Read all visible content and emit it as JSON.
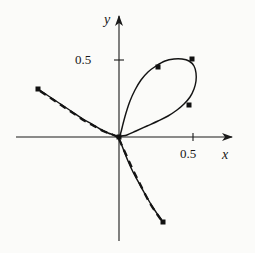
{
  "figure": {
    "kind": "parametric-curve-plot",
    "background": "#fbfbf9",
    "ink": "#1a1a1a"
  },
  "axes": {
    "x_label": "x",
    "y_label": "y",
    "x_ticks": [
      {
        "label": "0.5",
        "value": 0.5
      }
    ],
    "y_ticks": [
      {
        "label": "0.5",
        "value": 0.5
      }
    ],
    "origin_px": {
      "x": 119,
      "y": 137
    },
    "px_per_unit": {
      "x": 148,
      "y": 154
    },
    "x_axis_px": {
      "x1": 16,
      "x2": 232,
      "y": 137
    },
    "y_axis_px": {
      "x": 119,
      "y1": 16,
      "y2": 241
    },
    "arrowheads": [
      "x-positive",
      "y-positive"
    ]
  },
  "chart_data": {
    "type": "line",
    "title": "",
    "xlabel": "x",
    "ylabel": "y",
    "xlim": [
      -0.7,
      0.77
    ],
    "ylim": [
      -0.68,
      0.79
    ],
    "grid": false,
    "legend": null,
    "series": [
      {
        "name": "exact-curve",
        "style": "solid",
        "comment": "single parametric curve: upper-left branch, loop through origin in first quadrant, lower-right branch",
        "points_px": [
          [
            38,
            89
          ],
          [
            47,
            95
          ],
          [
            56,
            101
          ],
          [
            65,
            107
          ],
          [
            74,
            113
          ],
          [
            83,
            119
          ],
          [
            92,
            124
          ],
          [
            100,
            129
          ],
          [
            108,
            133
          ],
          [
            114,
            135
          ],
          [
            119,
            137
          ],
          [
            121,
            132
          ],
          [
            123,
            124
          ],
          [
            126,
            113
          ],
          [
            130,
            101
          ],
          [
            135,
            90
          ],
          [
            141,
            80
          ],
          [
            148,
            72
          ],
          [
            156,
            66
          ],
          [
            165,
            61
          ],
          [
            174,
            59
          ],
          [
            182,
            59
          ],
          [
            189,
            61
          ],
          [
            194,
            66
          ],
          [
            196,
            73
          ],
          [
            196,
            81
          ],
          [
            194,
            89
          ],
          [
            190,
            97
          ],
          [
            184,
            104
          ],
          [
            177,
            110
          ],
          [
            168,
            116
          ],
          [
            158,
            121
          ],
          [
            147,
            126
          ],
          [
            136,
            131
          ],
          [
            127,
            135
          ],
          [
            119,
            137
          ],
          [
            121,
            143
          ],
          [
            124,
            151
          ],
          [
            128,
            161
          ],
          [
            133,
            172
          ],
          [
            139,
            183
          ],
          [
            145,
            194
          ],
          [
            152,
            206
          ],
          [
            158,
            215
          ],
          [
            163,
            222
          ]
        ]
      },
      {
        "name": "approximation-dashed",
        "style": "dashed",
        "comment": "dashed approximation overlaid only on the two outer branches",
        "branch_upper_left_px": [
          [
            40,
            91
          ],
          [
            49,
            97
          ],
          [
            58,
            103
          ],
          [
            67,
            109
          ],
          [
            76,
            115
          ],
          [
            85,
            121
          ],
          [
            94,
            126
          ],
          [
            103,
            131
          ],
          [
            111,
            134
          ],
          [
            118,
            137
          ]
        ],
        "branch_lower_right_px": [
          [
            119,
            139
          ],
          [
            123,
            148
          ],
          [
            128,
            159
          ],
          [
            133,
            170
          ],
          [
            139,
            182
          ],
          [
            145,
            194
          ],
          [
            151,
            205
          ],
          [
            157,
            214
          ],
          [
            162,
            221
          ]
        ]
      }
    ],
    "markers": {
      "shape": "square",
      "size_px": 5,
      "points_px": [
        [
          38,
          89
        ],
        [
          119,
          137
        ],
        [
          158,
          67
        ],
        [
          192,
          59
        ],
        [
          189,
          105
        ],
        [
          163,
          222
        ]
      ],
      "points_data": [
        {
          "x": -0.547,
          "y": 0.312
        },
        {
          "x": 0.0,
          "y": 0.0
        },
        {
          "x": 0.264,
          "y": 0.455
        },
        {
          "x": 0.493,
          "y": 0.506
        },
        {
          "x": 0.473,
          "y": 0.208
        },
        {
          "x": 0.297,
          "y": -0.552
        }
      ]
    }
  }
}
